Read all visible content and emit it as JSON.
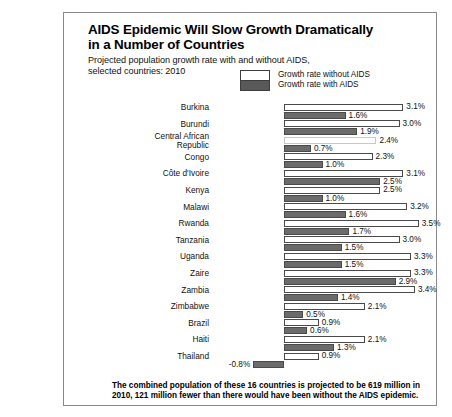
{
  "chart_data": {
    "type": "bar",
    "title": "AIDS Epidemic Will Slow Growth Dramatically in a Number of Countries",
    "title_line1": "AIDS Epidemic Will Slow Growth Dramatically",
    "title_line2": "in a Number of Countries",
    "subtitle_line1": "Projected population growth rate with and without AIDS,",
    "subtitle_line2": "selected countries:  2010",
    "xlabel": "",
    "ylabel": "",
    "orientation": "horizontal",
    "grid": false,
    "legend_position": "top-right",
    "xlim": [
      -0.8,
      3.5
    ],
    "zero_baseline": 0,
    "value_suffix": "%",
    "legend": [
      {
        "name": "Growth rate without AIDS",
        "color": "#ffffff"
      },
      {
        "name": "Growth rate with AIDS",
        "color": "#6b6b6b"
      }
    ],
    "categories": [
      "Burkina",
      "Burundi",
      "Central African\nRepublic",
      "Congo",
      "Côte d'Ivoire",
      "Kenya",
      "Malawi",
      "Rwanda",
      "Tanzania",
      "Uganda",
      "Zaire",
      "Zambia",
      "Zimbabwe",
      "Brazil",
      "Haiti",
      "Thailand"
    ],
    "series": [
      {
        "name": "Growth rate without AIDS",
        "values": [
          3.1,
          3.0,
          2.4,
          2.3,
          3.1,
          2.5,
          3.2,
          3.5,
          3.0,
          3.3,
          3.3,
          3.4,
          2.1,
          0.9,
          2.1,
          0.9
        ],
        "labels": [
          "3.1%",
          "3.0%",
          "2.4%",
          "2.3%",
          "3.1%",
          "2.5%",
          "3.2%",
          "3.5%",
          "3.0%",
          "3.3%",
          "3.3%",
          "3.4%",
          "2.1%",
          "0.9%",
          "2.1%",
          "0.9%"
        ]
      },
      {
        "name": "Growth rate with AIDS",
        "values": [
          1.6,
          1.9,
          0.7,
          1.0,
          2.5,
          1.0,
          1.6,
          1.7,
          1.5,
          1.5,
          2.9,
          1.4,
          0.5,
          0.6,
          1.3,
          -0.8
        ],
        "labels": [
          "1.6%",
          "1.9%",
          "0.7%",
          "1.0%",
          "2.5%",
          "1.0%",
          "1.6%",
          "1.7%",
          "1.5%",
          "1.5%",
          "2.9%",
          "1.4%",
          "0.5%",
          "0.6%",
          "1.3%",
          "-0.8%"
        ]
      }
    ],
    "footnote": "The combined population of these 16 countries is projected to be 619 million in 2010, 121 million fewer than there would have been without the AIDS epidemic."
  }
}
